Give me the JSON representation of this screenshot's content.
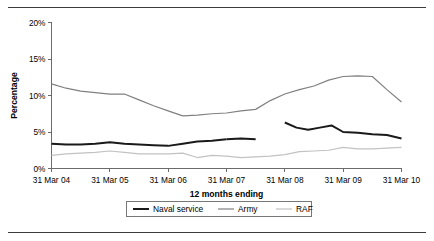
{
  "figure": {
    "divider_top": "#3c3c3c",
    "divider_bottom": "#3c3c3c"
  },
  "chart_data": {
    "type": "line",
    "title": "",
    "xlabel": "12 months ending",
    "ylabel": "Percentage",
    "ylim": [
      0,
      20
    ],
    "yticks": [
      0,
      5,
      10,
      15,
      20
    ],
    "ytick_labels": [
      "0%",
      "5%",
      "10%",
      "15%",
      "20%"
    ],
    "categories": [
      "31 Mar 04",
      "31 Mar 05",
      "31 Mar 06",
      "31 Mar 07",
      "31 Mar 08",
      "31 Mar 09",
      "31 Mar 10"
    ],
    "xlim": [
      2004.0,
      2010.0
    ],
    "grid": false,
    "legend_position": "bottom",
    "series": [
      {
        "name": "Naval service",
        "color": "#1a1a1a",
        "width": 2.0,
        "segments": [
          {
            "x": [
              2004.0,
              2004.25,
              2004.5,
              2004.75,
              2005.0,
              2005.25,
              2005.5,
              2005.75,
              2006.0,
              2006.25,
              2006.5,
              2006.75,
              2007.0
            ],
            "y": [
              3.4,
              3.3,
              3.3,
              3.4,
              3.6,
              3.4,
              3.3,
              3.2,
              3.1,
              3.4,
              3.7,
              3.8,
              4.0
            ]
          },
          {
            "x": [
              2007.0,
              2007.25,
              2007.5
            ],
            "y": [
              4.0,
              4.1,
              4.0
            ]
          },
          {
            "x": [
              2008.0,
              2008.2,
              2008.4,
              2008.6,
              2008.8,
              2009.0,
              2009.25,
              2009.5,
              2009.75,
              2010.0
            ],
            "y": [
              6.3,
              5.6,
              5.3,
              5.6,
              5.9,
              5.0,
              4.9,
              4.7,
              4.6,
              4.1
            ]
          }
        ]
      },
      {
        "name": "Army",
        "color": "#808080",
        "width": 1.2,
        "segments": [
          {
            "x": [
              2004.0,
              2004.25,
              2004.5,
              2004.75,
              2005.0,
              2005.25,
              2005.5,
              2005.75,
              2006.0,
              2006.25,
              2006.5,
              2006.75,
              2007.0,
              2007.25,
              2007.5,
              2007.75,
              2008.0,
              2008.25,
              2008.5,
              2008.75,
              2009.0,
              2009.25,
              2009.5,
              2009.75,
              2010.0
            ],
            "y": [
              11.6,
              11.0,
              10.6,
              10.4,
              10.2,
              10.2,
              9.4,
              8.6,
              7.9,
              7.2,
              7.3,
              7.5,
              7.6,
              7.9,
              8.1,
              9.3,
              10.2,
              10.8,
              11.3,
              12.1,
              12.6,
              12.7,
              12.6,
              10.8,
              9.1
            ]
          }
        ]
      },
      {
        "name": "RAF",
        "color": "#c2c2c2",
        "width": 1.2,
        "segments": [
          {
            "x": [
              2004.0,
              2004.25,
              2004.5,
              2004.75,
              2005.0,
              2005.25,
              2005.5,
              2005.75,
              2006.0,
              2006.25,
              2006.5,
              2006.75,
              2007.0,
              2007.25,
              2007.5,
              2007.75,
              2008.0,
              2008.25,
              2008.5,
              2008.75,
              2009.0,
              2009.25,
              2009.5,
              2009.75,
              2010.0
            ],
            "y": [
              1.8,
              2.0,
              2.1,
              2.2,
              2.4,
              2.2,
              2.0,
              2.0,
              2.0,
              2.1,
              1.5,
              1.8,
              1.7,
              1.5,
              1.6,
              1.7,
              1.9,
              2.3,
              2.4,
              2.5,
              2.9,
              2.7,
              2.7,
              2.8,
              2.9
            ]
          }
        ]
      }
    ],
    "legend": [
      {
        "label": "Naval service",
        "color": "#1a1a1a",
        "width": 2.0
      },
      {
        "label": "Army",
        "color": "#808080",
        "width": 1.2
      },
      {
        "label": "RAF",
        "color": "#c2c2c2",
        "width": 1.2
      }
    ]
  }
}
